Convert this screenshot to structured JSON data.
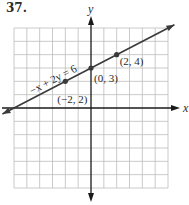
{
  "problem_number": "37.",
  "chart_data": {
    "type": "line",
    "title": "",
    "xlabel": "x",
    "ylabel": "y",
    "xlim": [
      -6,
      6
    ],
    "ylim": [
      -6,
      6
    ],
    "grid": true,
    "grid_step": 1,
    "series": [
      {
        "name": "-x + 2y = 6",
        "equation": "-x + 2y = 6",
        "slope": 0.5,
        "intercept": 3,
        "x_extent": [
          -6.9,
          6.5
        ]
      }
    ],
    "points": [
      {
        "x": -2,
        "y": 2,
        "label": "(−2, 2)"
      },
      {
        "x": 0,
        "y": 3,
        "label": "(0, 3)"
      },
      {
        "x": 2,
        "y": 4,
        "label": "(2, 4)"
      }
    ],
    "annotations": [
      {
        "text": "−x + 2y = 6",
        "attached_to": "line",
        "position": "above-left"
      }
    ]
  },
  "colors": {
    "grid": "#bdbdbd",
    "axis": "#1a1a1a",
    "line": "#3a3a3a",
    "point": "#3a3a3a",
    "text": "#2a2a2a"
  }
}
